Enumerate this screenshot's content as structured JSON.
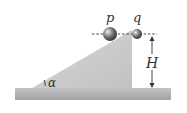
{
  "diagram": {
    "labels": {
      "ball_p": "p",
      "ball_q": "q",
      "height": "H",
      "angle": "α"
    },
    "colors": {
      "incline": "#c8c8c8",
      "ground_top": "#bdbdbd",
      "ground_bottom": "#9a9a9a",
      "ball": "#6a6a6a",
      "line": "#333333"
    }
  }
}
